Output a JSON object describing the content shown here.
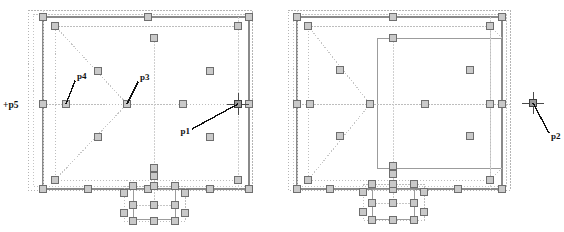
{
  "view": {
    "title": "CAD Plan View",
    "background_color": "#ffffff",
    "width": 564,
    "height": 232
  },
  "style": {
    "handle_fill": "#c9c9c9",
    "handle_stroke": "#6e6e6e",
    "handle_size": 7,
    "solid_line_color": "#8a8a8a",
    "dotted_line_color": "#b4b4b4",
    "leader_line_color": "#111111",
    "crosshair_color": "#4a4a4a",
    "label_color": "#111111"
  },
  "labels": [
    {
      "id": "p1",
      "text": "p1",
      "x": 186,
      "y": 132,
      "anchor": "end"
    },
    {
      "id": "p2",
      "text": "p2",
      "x": 551,
      "y": 136,
      "anchor": "start"
    },
    {
      "id": "p3",
      "text": "p3",
      "x": 140,
      "y": 80,
      "anchor": "start"
    },
    {
      "id": "p4",
      "text": "p4",
      "x": 77,
      "y": 79,
      "anchor": "start"
    },
    {
      "id": "p5",
      "text": "+p5",
      "x": 3,
      "y": 105,
      "anchor": "start"
    }
  ],
  "leader_lines": [
    {
      "id": "leader-p1",
      "from_x": 192,
      "from_y": 129,
      "to_x": 238,
      "to_y": 104
    },
    {
      "id": "leader-p2",
      "from_x": 549,
      "from_y": 133,
      "to_x": 533,
      "to_y": 103
    },
    {
      "id": "leader-p3",
      "from_x": 138,
      "from_y": 82,
      "to_x": 127,
      "to_y": 104
    },
    {
      "id": "leader-p4",
      "from_x": 75,
      "from_y": 81,
      "to_x": 66,
      "to_y": 104
    }
  ],
  "crosshairs": [
    {
      "id": "crosshair-p1",
      "cx": 238,
      "cy": 104,
      "arm": 11
    },
    {
      "id": "crosshair-p2",
      "cx": 533,
      "cy": 103,
      "arm": 11
    }
  ],
  "plans": [
    {
      "id": "left-plan",
      "name": "left-floor-plan",
      "bounds": {
        "x": 28,
        "y": 10,
        "w": 224,
        "h": 180
      },
      "note": "outer dotted selection boundary with inner solid wall outline, triangular dotted construction lines and bottom entry bay"
    },
    {
      "id": "right-plan",
      "name": "right-floor-plan",
      "bounds": {
        "x": 294,
        "y": 10,
        "w": 224,
        "h": 180
      },
      "note": "outer dotted selection boundary with inner solid wall outline, triangular dotted construction lines and bottom entry bay"
    }
  ],
  "handles": {
    "left_plan": [
      [
        43,
        17
      ],
      [
        148,
        17
      ],
      [
        249,
        17
      ],
      [
        55,
        26
      ],
      [
        238,
        26
      ],
      [
        154,
        38
      ],
      [
        98,
        71
      ],
      [
        210,
        71
      ],
      [
        43,
        104
      ],
      [
        66,
        104
      ],
      [
        127,
        104
      ],
      [
        183,
        104
      ],
      [
        238,
        104
      ],
      [
        249,
        104
      ],
      [
        98,
        137
      ],
      [
        210,
        137
      ],
      [
        154,
        168
      ],
      [
        55,
        180
      ],
      [
        238,
        180
      ],
      [
        43,
        189
      ],
      [
        88,
        189
      ],
      [
        148,
        189
      ],
      [
        210,
        189
      ],
      [
        249,
        189
      ],
      [
        154,
        176
      ],
      [
        133,
        186
      ],
      [
        154,
        186
      ],
      [
        175,
        186
      ],
      [
        124,
        193
      ],
      [
        185,
        193
      ],
      [
        133,
        205
      ],
      [
        154,
        205
      ],
      [
        175,
        205
      ],
      [
        124,
        213
      ],
      [
        185,
        213
      ],
      [
        133,
        221
      ],
      [
        154,
        221
      ],
      [
        175,
        221
      ]
    ],
    "right_plan": [
      [
        297,
        17
      ],
      [
        393,
        17
      ],
      [
        502,
        17
      ],
      [
        308,
        26
      ],
      [
        490,
        26
      ],
      [
        393,
        38
      ],
      [
        340,
        70
      ],
      [
        470,
        70
      ],
      [
        297,
        104
      ],
      [
        310,
        104
      ],
      [
        370,
        104
      ],
      [
        425,
        104
      ],
      [
        490,
        104
      ],
      [
        502,
        104
      ],
      [
        340,
        136
      ],
      [
        470,
        136
      ],
      [
        393,
        166
      ],
      [
        308,
        180
      ],
      [
        490,
        180
      ],
      [
        297,
        189
      ],
      [
        330,
        189
      ],
      [
        393,
        189
      ],
      [
        458,
        189
      ],
      [
        502,
        189
      ],
      [
        393,
        174
      ],
      [
        372,
        184
      ],
      [
        393,
        184
      ],
      [
        414,
        184
      ],
      [
        363,
        192
      ],
      [
        424,
        192
      ],
      [
        372,
        203
      ],
      [
        393,
        203
      ],
      [
        414,
        203
      ],
      [
        363,
        212
      ],
      [
        424,
        212
      ],
      [
        372,
        220
      ],
      [
        393,
        220
      ],
      [
        414,
        220
      ]
    ]
  }
}
